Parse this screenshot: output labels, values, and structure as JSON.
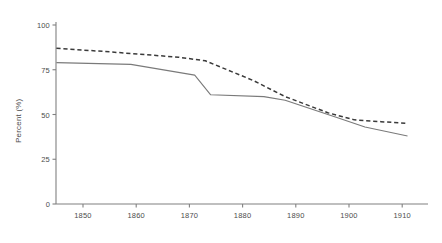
{
  "chart_data": {
    "type": "line",
    "title": "",
    "xlabel": "",
    "ylabel": "Percent (%)",
    "xlim": [
      1845,
      1912
    ],
    "ylim": [
      0,
      105
    ],
    "yticks": [
      0,
      25,
      50,
      75,
      100
    ],
    "ytick_labels": [
      "0",
      "25",
      "50",
      "75",
      "100"
    ],
    "xticks": [
      1850,
      1860,
      1870,
      1880,
      1890,
      1900,
      1910
    ],
    "xtick_labels": [
      "1850",
      "1860",
      "1870",
      "1880",
      "1890",
      "1900",
      "1910"
    ],
    "grid": false,
    "legend": "none",
    "series": [
      {
        "name": "dashed-series",
        "style": "dashed",
        "color": "#3a3a3a",
        "x": [
          1845,
          1855,
          1868,
          1873,
          1882,
          1888,
          1896,
          1901,
          1906,
          1911
        ],
        "values": [
          87,
          85,
          82,
          80,
          69,
          60,
          51,
          47,
          46,
          45
        ]
      },
      {
        "name": "solid-series",
        "style": "solid",
        "color": "#7a7a7a",
        "x": [
          1845,
          1859,
          1871,
          1874,
          1884,
          1888,
          1898,
          1903,
          1911
        ],
        "values": [
          79,
          78,
          72,
          61,
          60,
          58,
          48,
          43,
          38
        ]
      }
    ]
  },
  "axis": {
    "line_color": "#808080",
    "tick_color": "#808080",
    "label_color": "#4d4d4d"
  }
}
